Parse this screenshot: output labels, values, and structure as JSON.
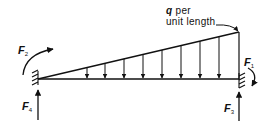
{
  "diagram": {
    "load_label": {
      "symbol": "q",
      "line1_rest": "per",
      "line2": "unit length"
    },
    "forces": [
      {
        "id": "F1",
        "symbol": "F",
        "subscript": "1",
        "kind": "moment",
        "location": "right support"
      },
      {
        "id": "F2",
        "symbol": "F",
        "subscript": "2",
        "kind": "moment",
        "location": "left support"
      },
      {
        "id": "F3",
        "symbol": "F",
        "subscript": "3",
        "kind": "vertical reaction",
        "location": "right support"
      },
      {
        "id": "F4",
        "symbol": "F",
        "subscript": "4",
        "kind": "vertical reaction",
        "location": "left support"
      }
    ],
    "load_arrow_count": 8,
    "colors": {
      "ink": "#111111",
      "background": "#ffffff"
    }
  }
}
